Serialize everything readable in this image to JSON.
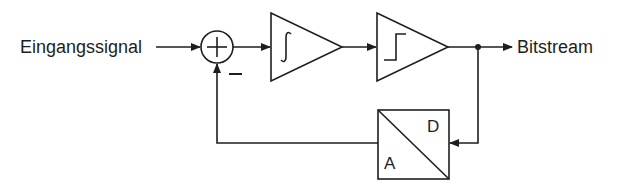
{
  "diagram": {
    "input_label": "Eingangssignal",
    "output_label": "Bitstream",
    "summer": {
      "sign_plus": "+",
      "sign_minus": "−"
    },
    "integrator": {
      "symbol": "∫",
      "name": "Integrator"
    },
    "comparator": {
      "symbol": "step",
      "name": "Comparator"
    },
    "dac": {
      "label_top": "D",
      "label_bottom": "A",
      "name": "D/A Converter"
    },
    "colors": {
      "stroke": "#1e1e1e",
      "background": "#ffffff"
    }
  }
}
